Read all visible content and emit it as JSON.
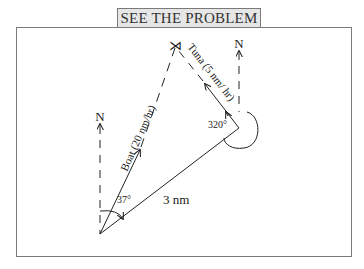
{
  "title": "SEE THE PROBLEM",
  "diagram": {
    "north_label_left": "N",
    "north_label_right": "N",
    "boat_label": "Boat (20 nm/hr)",
    "tuna_label": "Tuna (5 nm/ hr)",
    "distance_label": "3 nm",
    "boat_angle_label": "37°",
    "tuna_angle_label": "320°",
    "intercept_symbol": "⋊"
  },
  "colors": {
    "line": "#222222",
    "frame": "#7a7a7a",
    "tab_fill": "#e6e6e6"
  }
}
